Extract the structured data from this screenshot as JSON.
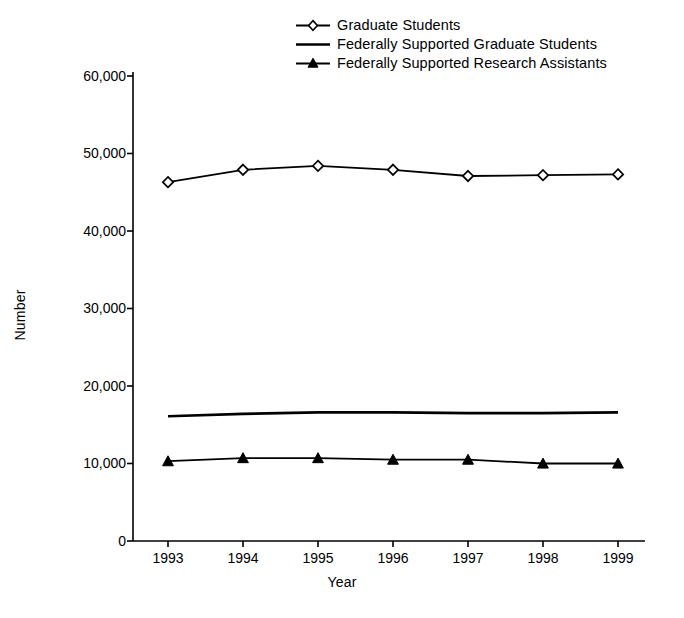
{
  "chart_data": {
    "type": "line",
    "title": "",
    "xlabel": "Year",
    "ylabel": "Number",
    "x": [
      "1993",
      "1994",
      "1995",
      "1996",
      "1997",
      "1998",
      "1999"
    ],
    "categories": [
      "1993",
      "1994",
      "1995",
      "1996",
      "1997",
      "1998",
      "1999"
    ],
    "xlim": [
      1993,
      1999
    ],
    "ylim": [
      0,
      60000
    ],
    "ytick_labels": [
      "60,000",
      "50,000",
      "40,000",
      "30,000",
      "20,000",
      "10,000",
      "0"
    ],
    "ytick_values": [
      60000,
      50000,
      40000,
      30000,
      20000,
      10000,
      0
    ],
    "grid": false,
    "legend_position": "top-center",
    "series": [
      {
        "name": "Graduate Students",
        "marker": "open-diamond",
        "values": [
          46300,
          47900,
          48400,
          47900,
          47100,
          47200,
          47300
        ]
      },
      {
        "name": "Federally Supported Graduate Students",
        "marker": "none",
        "values": [
          16100,
          16400,
          16600,
          16600,
          16500,
          16500,
          16600
        ]
      },
      {
        "name": "Federally Supported Research Assistants",
        "marker": "filled-triangle",
        "values": [
          10300,
          10700,
          10700,
          10500,
          10500,
          10000,
          10000
        ]
      }
    ]
  },
  "colors": {
    "ink": "#000000",
    "background": "#ffffff"
  }
}
